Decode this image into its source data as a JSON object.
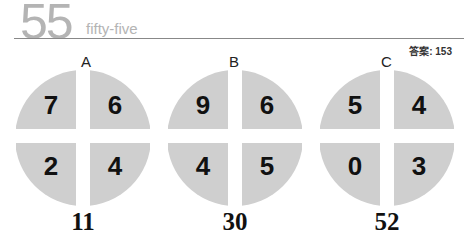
{
  "header": {
    "number": "55",
    "word": "fifty-five",
    "answer_label": "答案:",
    "answer_value": "153"
  },
  "puzzles": [
    {
      "label": "A",
      "quadrants": {
        "top_left": "7",
        "top_right": "6",
        "bottom_left": "2",
        "bottom_right": "4"
      },
      "result": "11"
    },
    {
      "label": "B",
      "quadrants": {
        "top_left": "9",
        "top_right": "6",
        "bottom_left": "4",
        "bottom_right": "5"
      },
      "result": "30"
    },
    {
      "label": "C",
      "quadrants": {
        "top_left": "5",
        "top_right": "4",
        "bottom_left": "0",
        "bottom_right": "3"
      },
      "result": "52"
    }
  ],
  "colors": {
    "disc": "#cfcfcf",
    "header_gray": "#b4b4b4",
    "text": "#111111"
  }
}
